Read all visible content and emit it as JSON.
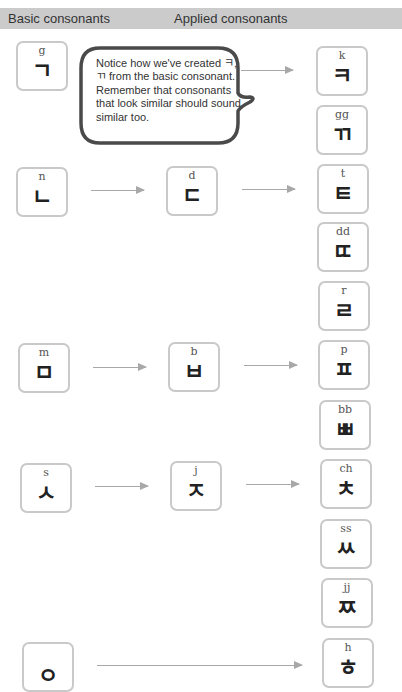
{
  "header": {
    "basic_label": "Basic consonants",
    "applied_label": "Applied consonants",
    "bar_color": "#cbcbcb"
  },
  "callout": {
    "text": "Notice how we've created ㅋ, ㄲ from the basic consonant. Remember that consonants that look similar should sound similar too."
  },
  "tiles": {
    "g": {
      "rom": "g",
      "jamo": "ㄱ"
    },
    "n": {
      "rom": "n",
      "jamo": "ㄴ"
    },
    "m": {
      "rom": "m",
      "jamo": "ㅁ"
    },
    "s": {
      "rom": "s",
      "jamo": "ㅅ"
    },
    "ng": {
      "rom": "",
      "jamo": "ㅇ"
    },
    "d": {
      "rom": "d",
      "jamo": "ㄷ"
    },
    "b": {
      "rom": "b",
      "jamo": "ㅂ"
    },
    "j": {
      "rom": "j",
      "jamo": "ㅈ"
    },
    "k": {
      "rom": "k",
      "jamo": "ㅋ"
    },
    "gg": {
      "rom": "gg",
      "jamo": "ㄲ"
    },
    "t": {
      "rom": "t",
      "jamo": "ㅌ"
    },
    "dd": {
      "rom": "dd",
      "jamo": "ㄸ"
    },
    "r": {
      "rom": "r",
      "jamo": "ㄹ"
    },
    "p": {
      "rom": "p",
      "jamo": "ㅍ"
    },
    "bb": {
      "rom": "bb",
      "jamo": "ㅃ"
    },
    "ch": {
      "rom": "ch",
      "jamo": "ㅊ"
    },
    "ss": {
      "rom": "ss",
      "jamo": "ㅆ"
    },
    "jj": {
      "rom": "jj",
      "jamo": "ㅉ"
    },
    "h": {
      "rom": "h",
      "jamo": "ㅎ"
    }
  },
  "colors": {
    "tile_border": "#c9c9c9",
    "arrow": "#a8a8a8",
    "bubble_border": "#4a4a4a"
  }
}
